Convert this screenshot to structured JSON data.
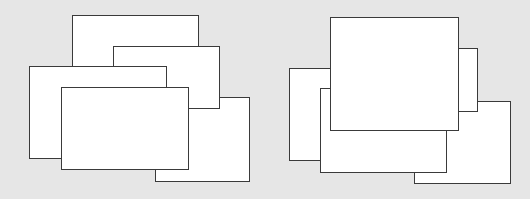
{
  "background": "#e6e6e6",
  "border_color": "#3a3a3a",
  "fill_color": "#ffffff",
  "groups": [
    {
      "name": "left-overlapping-windows",
      "windows": [
        {
          "id": "A",
          "left": 72,
          "top": 15,
          "width": 127,
          "height": 114,
          "z": 1
        },
        {
          "id": "C",
          "left": 155,
          "top": 97,
          "width": 95,
          "height": 85,
          "z": 2
        },
        {
          "id": "B",
          "left": 113,
          "top": 46,
          "width": 107,
          "height": 63,
          "z": 3
        },
        {
          "id": "D",
          "left": 29,
          "top": 66,
          "width": 138,
          "height": 93,
          "z": 4
        },
        {
          "id": "E",
          "left": 61,
          "top": 87,
          "width": 128,
          "height": 83,
          "z": 5
        }
      ]
    },
    {
      "name": "right-overlapping-windows",
      "windows": [
        {
          "id": "R",
          "left": 414,
          "top": 101,
          "width": 97,
          "height": 83,
          "z": 1
        },
        {
          "id": "Q",
          "left": 400,
          "top": 48,
          "width": 78,
          "height": 64,
          "z": 2
        },
        {
          "id": "P",
          "left": 289,
          "top": 68,
          "width": 100,
          "height": 93,
          "z": 3
        },
        {
          "id": "S",
          "left": 320,
          "top": 88,
          "width": 127,
          "height": 85,
          "z": 4
        },
        {
          "id": "T",
          "left": 330,
          "top": 17,
          "width": 129,
          "height": 114,
          "z": 5
        }
      ]
    }
  ]
}
